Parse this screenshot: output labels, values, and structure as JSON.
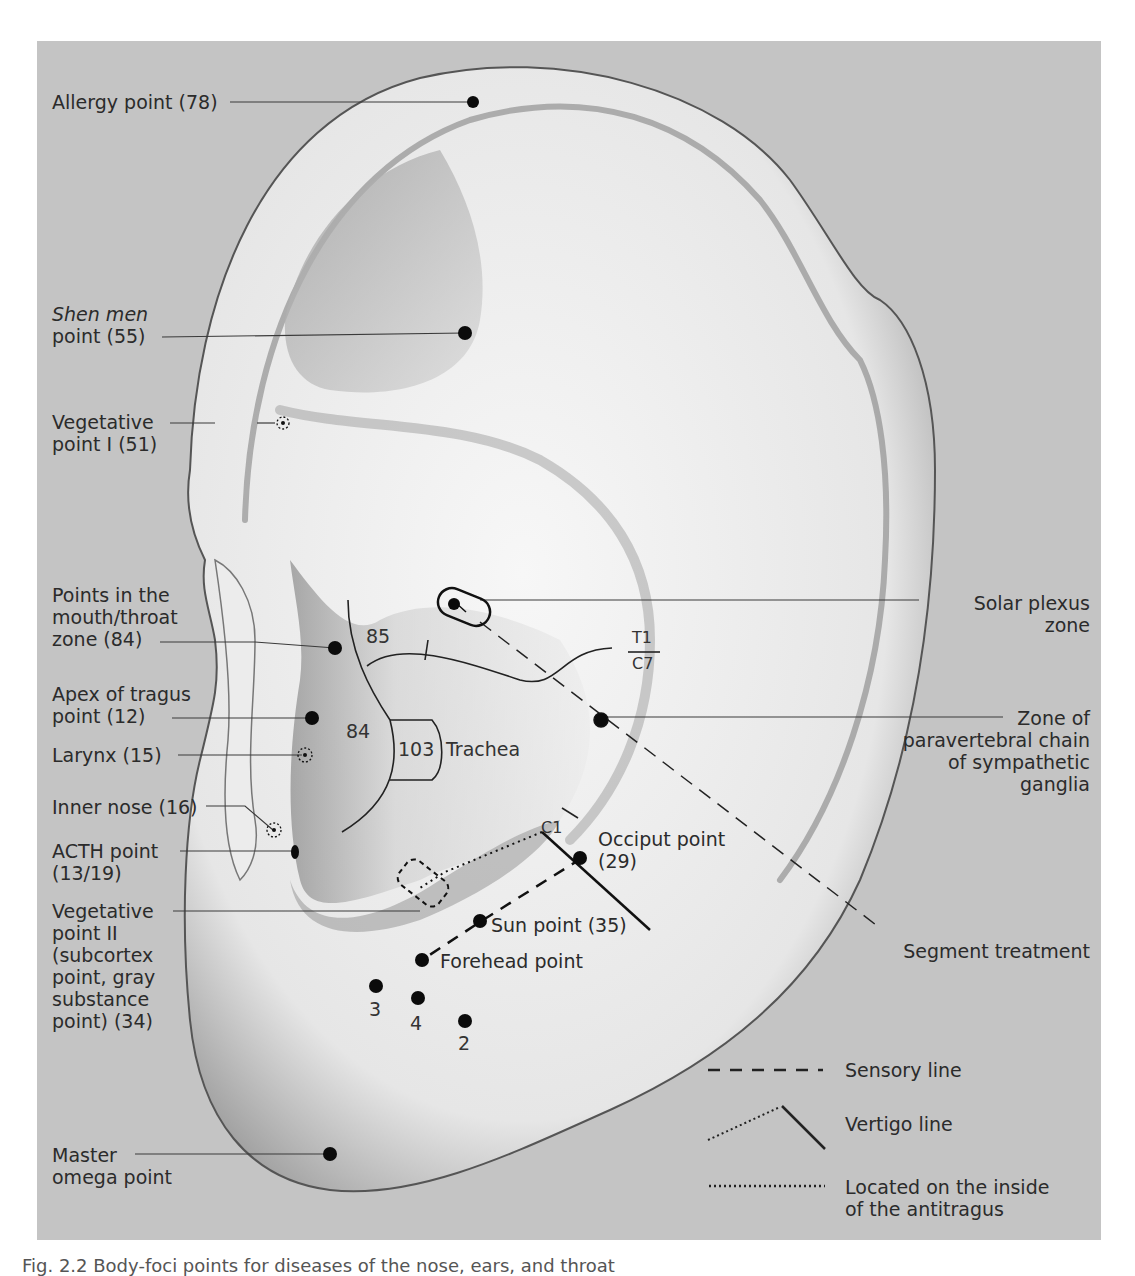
{
  "figure": {
    "caption": "Fig. 2.2 Body-foci points for diseases of the nose, ears, and throat",
    "background_color": "#c4c4c4",
    "ear_fill": "#f2f2f2",
    "ink_color": "#111111"
  },
  "left_labels": [
    {
      "id": "allergy",
      "lines": [
        "Allergy point (78)"
      ]
    },
    {
      "id": "shen-men",
      "lines": [
        "Shen men",
        "point (55)"
      ],
      "italic_first_line": true
    },
    {
      "id": "vegetative-1",
      "lines": [
        "Vegetative",
        "point I (51)"
      ]
    },
    {
      "id": "mouth-throat",
      "lines": [
        "Points in the",
        "mouth/throat",
        "zone (84)"
      ]
    },
    {
      "id": "apex-tragus",
      "lines": [
        "Apex of tragus",
        "point (12)"
      ]
    },
    {
      "id": "larynx",
      "lines": [
        "Larynx (15)"
      ]
    },
    {
      "id": "inner-nose",
      "lines": [
        "Inner nose (16)"
      ]
    },
    {
      "id": "acth",
      "lines": [
        "ACTH point",
        "(13/19)"
      ]
    },
    {
      "id": "vegetative-2",
      "lines": [
        "Vegetative",
        "point II",
        "(subcortex",
        "point, gray",
        "substance",
        "point) (34)"
      ]
    },
    {
      "id": "master-omega",
      "lines": [
        "Master",
        "omega point"
      ]
    }
  ],
  "right_labels": [
    {
      "id": "solar-plexus",
      "lines": [
        "Solar plexus",
        "zone"
      ]
    },
    {
      "id": "paravertebral",
      "lines": [
        "Zone of",
        "paravertebral chain",
        "of sympathetic",
        "ganglia"
      ]
    },
    {
      "id": "segment-treatment",
      "lines": [
        "Segment treatment"
      ]
    }
  ],
  "inner_labels": {
    "zone_85": "85",
    "zone_84": "84",
    "zone_103": "103",
    "trachea": "Trachea",
    "t1": "T1",
    "c7": "C7",
    "c1": "C1",
    "occiput": [
      "Occiput point",
      "(29)"
    ],
    "sun": "Sun point (35)",
    "forehead": "Forehead point",
    "point_3": "3",
    "point_4": "4",
    "point_2": "2"
  },
  "legend": [
    {
      "style": "dashed",
      "label": "Sensory line"
    },
    {
      "style": "dotted-then-solid",
      "label": "Vertigo line"
    },
    {
      "style": "dotted",
      "label": [
        "Located on the inside",
        "of the antitragus"
      ]
    }
  ]
}
